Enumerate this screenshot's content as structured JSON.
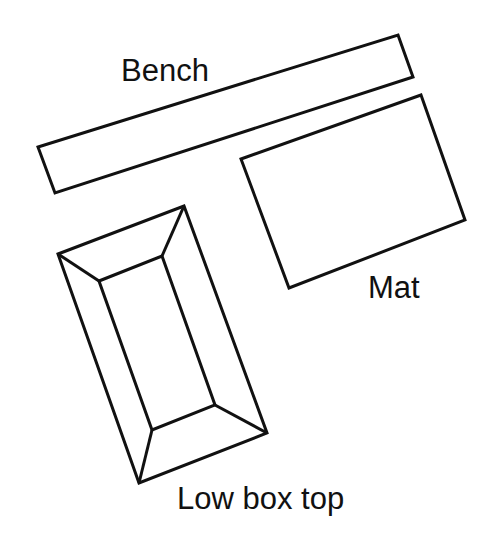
{
  "diagram": {
    "type": "floor-plan",
    "stroke_color": "#111111",
    "background_color": "#ffffff",
    "items": [
      {
        "id": "bench",
        "label": "Bench",
        "shape": "rectangle",
        "points": "398,35 413,77 55,193 38,147"
      },
      {
        "id": "mat",
        "label": "Mat",
        "shape": "rectangle",
        "points": "421,95 465,220 289,288 241,159"
      },
      {
        "id": "low-box-top",
        "label": "Low box top",
        "shape": "beveled-rectangle",
        "outer_points": "58,254 184,206 267,433 139,483",
        "inner_points": "99,281 162,256 215,405 152,430"
      }
    ]
  }
}
